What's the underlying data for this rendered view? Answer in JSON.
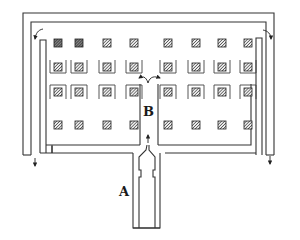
{
  "diagram": {
    "type": "floor-plan airflow schematic",
    "labels": {
      "inlet": "A",
      "center_aisle": "B"
    },
    "grid": {
      "rows": 4,
      "columns": 8,
      "description": "hatched square objects arranged in a 4x8 grid; rows 2 and 3 have U-shaped baffles around each object"
    },
    "colors": {
      "line": "#333333",
      "hatch": "#444444",
      "background": "#ffffff"
    },
    "flows": [
      {
        "name": "inlet-flow",
        "direction": "up through duct A into aisle B"
      },
      {
        "name": "split-flow",
        "direction": "splits left and right at top of aisle B"
      },
      {
        "name": "corner-left",
        "direction": "turns down at top-left corner"
      },
      {
        "name": "corner-right",
        "direction": "turns down at top-right corner"
      },
      {
        "name": "exit-left",
        "direction": "down and out bottom-left"
      },
      {
        "name": "exit-right",
        "direction": "down and out bottom-right"
      }
    ]
  }
}
